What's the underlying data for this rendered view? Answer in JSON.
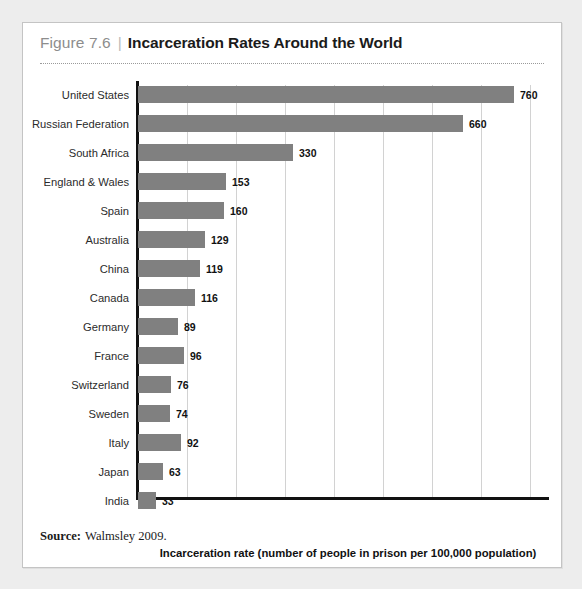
{
  "figure": {
    "number": "Figure 7.6",
    "separator": "|",
    "title": "Incarceration Rates Around the World",
    "source_label": "Source:",
    "source_text": "Walmsley 2009."
  },
  "chart_data": {
    "type": "bar",
    "orientation": "horizontal",
    "title": "Incarceration Rates Around the World",
    "xlabel": "Incarceration rate (number of people in prison per 100,000 population)",
    "ylabel": "",
    "categories": [
      "United States",
      "Russian Federation",
      "South Africa",
      "England & Wales",
      "Spain",
      "Australia",
      "China",
      "Canada",
      "Germany",
      "France",
      "Switzerland",
      "Sweden",
      "Italy",
      "Japan",
      "India"
    ],
    "values": [
      760,
      660,
      330,
      153,
      160,
      129,
      119,
      116,
      89,
      96,
      76,
      74,
      92,
      63,
      33
    ],
    "bar_pixel_widths": [
      376,
      325,
      155,
      88,
      86,
      67,
      62,
      57,
      40,
      46,
      33,
      32,
      43,
      25,
      18
    ],
    "value_labels": [
      "760",
      "660",
      "330",
      "153",
      "160",
      "129",
      "119",
      "116",
      "89",
      "96",
      "76",
      "74",
      "92",
      "63",
      "33"
    ],
    "bar_color": "#808080",
    "gridline_color": "#d2d2d2",
    "gridline_positions": [
      49,
      98,
      147,
      196,
      245,
      294,
      343,
      392
    ],
    "axis_color": "#111111",
    "grid": true,
    "legend": false,
    "xlim": [
      0,
      830
    ]
  },
  "colors": {
    "page_background": "#ededed",
    "figure_background": "#ffffff",
    "figure_border": "#c4c4c4",
    "figure_number": "#8d8d8d",
    "title_text": "#1b1b1b",
    "bar": "#808080"
  }
}
